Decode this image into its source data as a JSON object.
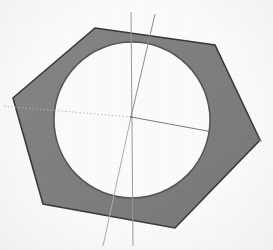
{
  "figure": {
    "background_color": "#fdfdfd"
  },
  "colors": {
    "hexagon_fill": "#808080",
    "hexagon_stroke": "#3a3a3a",
    "circle_fill": "#ffffff",
    "circle_stroke": "#555555",
    "axis_line": "#9a9a9a",
    "axis_line_dark": "#6e6e6e",
    "dotted_line": "#b5b5b5",
    "center_dot": "#707070"
  },
  "chart_data": {
    "type": "diagram",
    "units": "pixels",
    "canvas": {
      "width": 273,
      "height": 250
    },
    "shapes": [
      {
        "name": "outer-hexagon",
        "kind": "polygon",
        "fill": "#808080",
        "stroke": "#3a3a3a",
        "stroke_width": 1.6,
        "vertices": [
          {
            "label": "V1-top-left",
            "x": 95,
            "y": 28
          },
          {
            "label": "V2-top-right",
            "x": 215,
            "y": 45
          },
          {
            "label": "V3-right",
            "x": 260,
            "y": 140
          },
          {
            "label": "V4-bottom-right",
            "x": 175,
            "y": 228
          },
          {
            "label": "V5-bottom-left",
            "x": 43,
            "y": 204
          },
          {
            "label": "V6-left",
            "x": 13,
            "y": 98
          }
        ]
      },
      {
        "name": "inner-circle-hole",
        "kind": "circle",
        "fill": "#ffffff",
        "stroke": "#555555",
        "stroke_width": 1.5,
        "center": {
          "x": 132,
          "y": 120
        },
        "radius": 78
      }
    ],
    "center_point": {
      "x": 131,
      "y": 117
    },
    "axis_lines": [
      {
        "name": "vertical-axis",
        "style": "solid",
        "color": "#9a9a9a",
        "width": 1.0,
        "from": {
          "x": 131,
          "y": 12
        },
        "to": {
          "x": 133,
          "y": 246
        }
      },
      {
        "name": "upper-right-oblique-axis",
        "style": "solid",
        "color": "#8d8d8d",
        "width": 1.0,
        "from": {
          "x": 155,
          "y": 14
        },
        "to": {
          "x": 131,
          "y": 117
        }
      },
      {
        "name": "lower-left-oblique-axis",
        "style": "solid",
        "color": "#b0b0b0",
        "width": 1.0,
        "from": {
          "x": 131,
          "y": 117
        },
        "to": {
          "x": 103,
          "y": 246
        }
      },
      {
        "name": "horizontal-axis-right",
        "style": "solid",
        "color": "#7a7a7a",
        "width": 1.0,
        "from": {
          "x": 131,
          "y": 117
        },
        "to": {
          "x": 262,
          "y": 141
        }
      },
      {
        "name": "horizontal-axis-left-dotted",
        "style": "dotted",
        "color": "#b5b5b5",
        "width": 1.0,
        "from": {
          "x": 131,
          "y": 117
        },
        "to": {
          "x": 2,
          "y": 106
        }
      }
    ],
    "annotations": [],
    "legend": {
      "entries": [],
      "position": "none"
    },
    "grid": false
  }
}
